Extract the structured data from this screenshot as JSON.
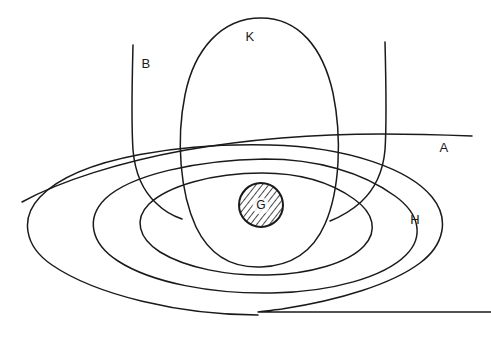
{
  "figure": {
    "kind": "line-art-diagram",
    "width": 491,
    "height": 341,
    "background_color": "#ffffff",
    "stroke_color": "#1a1a1a",
    "labels": {
      "a": "A",
      "b": "B",
      "k": "K",
      "g": "G",
      "h": "H"
    },
    "label_positions": {
      "a": {
        "x": 444,
        "y": 149
      },
      "b": {
        "x": 146,
        "y": 65
      },
      "k": {
        "x": 250,
        "y": 38
      },
      "g": {
        "x": 261,
        "y": 206
      },
      "h": {
        "x": 415,
        "y": 221
      }
    },
    "elements": [
      {
        "name": "curve-a",
        "label": "A",
        "type": "open-curve",
        "description": "near-horizontal curve sweeping from lower left upward to the right and flattening into a straight segment that terminates at the right margin"
      },
      {
        "name": "curve-b",
        "label": "B",
        "type": "open-curve",
        "description": "steep line descending from the upper area then bending to the right toward the lower middle"
      },
      {
        "name": "curve-right-vertical",
        "label": "",
        "type": "open-curve",
        "description": "steep line descending from the upper right then bending to the left toward the lower middle"
      },
      {
        "name": "oval-k",
        "label": "K",
        "type": "closed-oval",
        "description": "tall vertically oriented oval occupying the upper middle of the figure"
      },
      {
        "name": "ellipse-h-outer",
        "label": "H",
        "type": "open-ellipse",
        "description": "large wide ellipse whose lower right portion straightens into a horizontal line running off the right edge"
      },
      {
        "name": "ellipse-h-middle",
        "label": "",
        "type": "closed-ellipse",
        "description": "wide ellipse nested inside the outer ellipse"
      },
      {
        "name": "ellipse-h-inner",
        "label": "",
        "type": "closed-ellipse",
        "description": "smaller wide ellipse nested inside the middle ellipse"
      },
      {
        "name": "circle-g",
        "label": "G",
        "type": "hatched-circle",
        "description": "small circle with diagonal hatch fill at the centre of the nested ellipses",
        "center": {
          "x": 261,
          "y": 205
        },
        "radius": 22
      }
    ]
  }
}
